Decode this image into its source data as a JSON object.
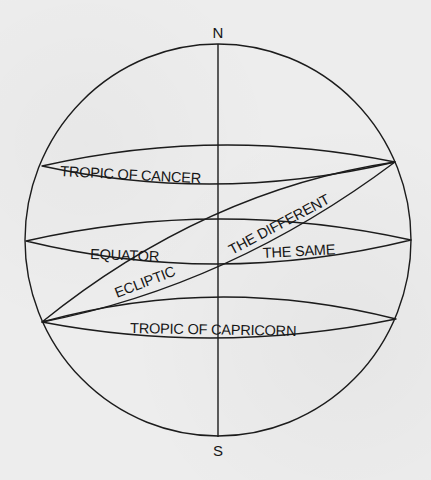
{
  "diagram": {
    "colors": {
      "background": "#ededed",
      "ink": "#1c1c1c"
    },
    "globe": {
      "cx": 218,
      "cy": 240,
      "rx": 193,
      "ry": 196
    },
    "axis": {
      "x": 218,
      "y1": 44,
      "y2": 437
    },
    "poles": {
      "north": {
        "label": "N",
        "x": 218,
        "y": 38
      },
      "south": {
        "label": "S",
        "x": 218,
        "y": 456
      }
    },
    "bands": [
      {
        "id": "tropic-of-cancer",
        "left": [
          42,
          166
        ],
        "right": [
          395,
          162
        ],
        "upper_through": [
          218,
          145
        ],
        "lower_through": [
          218,
          184
        ]
      },
      {
        "id": "equator",
        "left": [
          26,
          241
        ],
        "right": [
          411,
          240
        ],
        "upper_through": [
          218,
          219
        ],
        "lower_through": [
          218,
          264
        ]
      },
      {
        "id": "tropic-of-capricorn",
        "left": [
          42,
          322
        ],
        "right": [
          396,
          319
        ],
        "upper_through": [
          218,
          297
        ],
        "lower_through": [
          218,
          338
        ]
      },
      {
        "id": "ecliptic",
        "left": [
          42,
          322
        ],
        "right": [
          395,
          162
        ],
        "upper_through": [
          212,
          216
        ],
        "lower_through": [
          224,
          264
        ]
      }
    ],
    "labels": {
      "tropic_of_cancer": {
        "text": "TROPIC OF CANCER",
        "x": 60,
        "y": 176,
        "rotate": 3
      },
      "equator": {
        "text": "EQUATOR",
        "x": 90,
        "y": 259,
        "rotate": 2
      },
      "ecliptic": {
        "text": "ECLIPTIC",
        "x": 117,
        "y": 298,
        "rotate": -21
      },
      "the_different": {
        "text": "THE DIFFERENT",
        "x": 232,
        "y": 255,
        "rotate": -28
      },
      "the_same": {
        "text": "THE SAME",
        "x": 263,
        "y": 258,
        "rotate": -3
      },
      "tropic_of_capricorn": {
        "text": "TROPIC OF CAPRICORN",
        "x": 130,
        "y": 333,
        "rotate": 1
      }
    }
  }
}
